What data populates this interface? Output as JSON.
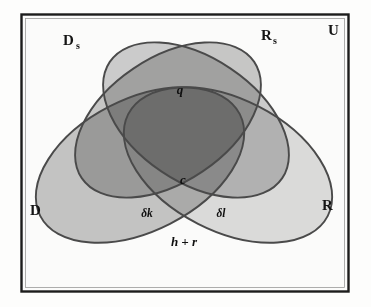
{
  "figure": {
    "kind": "venn-diagram",
    "set_count": 4,
    "background_color": "#fdfdfc",
    "frame_color": "#1c1c1c",
    "outline_color": "#4a4a4a"
  },
  "universe": {
    "label": "U",
    "description": "rectangular frame enclosing all sets"
  },
  "sets": [
    {
      "id": "ds",
      "label": "D",
      "subscript": "s",
      "position": "top-left",
      "fill": "#c9c9c9"
    },
    {
      "id": "rs",
      "label": "R",
      "subscript": "s",
      "position": "top-right",
      "fill": "#cfcfcf"
    },
    {
      "id": "d",
      "label": "D",
      "subscript": "",
      "position": "left",
      "fill": "#c4c4c4"
    },
    {
      "id": "r",
      "label": "R",
      "subscript": "",
      "position": "right",
      "fill": "#dcdcdc"
    }
  ],
  "regions": [
    {
      "id": "q",
      "label": "q",
      "meaning": "Ds-and-Rs upper intersection"
    },
    {
      "id": "c",
      "label": "c",
      "meaning": "intersection of all four sets"
    },
    {
      "id": "dk",
      "label": "δk",
      "meaning": "lower-left intersection"
    },
    {
      "id": "dl",
      "label": "δl",
      "meaning": "lower-right intersection"
    },
    {
      "id": "hr",
      "label": "h + r",
      "meaning": "lower D-and-R intersection"
    }
  ]
}
